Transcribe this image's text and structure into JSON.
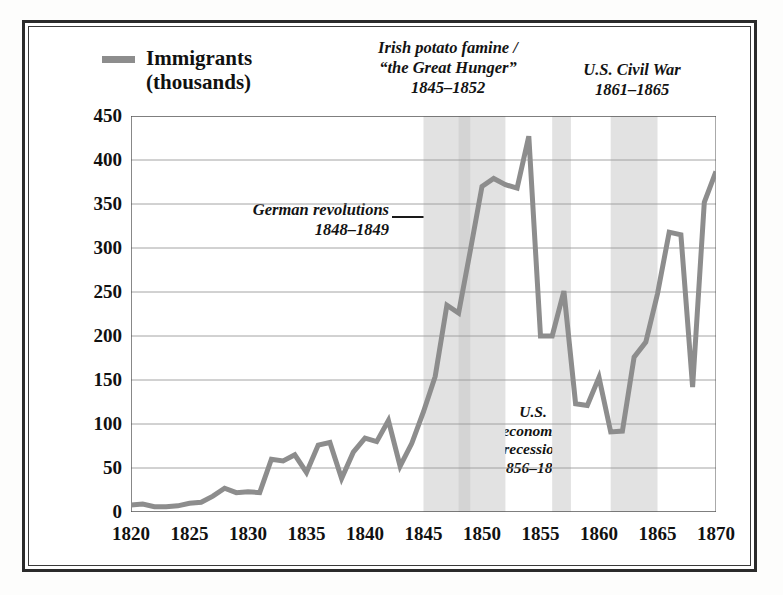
{
  "legend": {
    "label": "Immigrants\n(thousands)",
    "swatch_color": "#8d8d8d"
  },
  "annotations": {
    "famine": "Irish potato famine /\n“the Great Hunger”\n1845–1852",
    "civil_war": "U.S. Civil War\n1861–1865",
    "german": "German revolutions\n1848–1849",
    "recession": "U.S.\neconomic\nrecession\n1856–1857"
  },
  "chart_data": {
    "type": "line",
    "title": "",
    "xlabel": "",
    "ylabel": "Immigrants (thousands)",
    "xlim": [
      1820,
      1870
    ],
    "ylim": [
      0,
      450
    ],
    "xticks": [
      1820,
      1825,
      1830,
      1835,
      1840,
      1845,
      1850,
      1855,
      1860,
      1865,
      1870
    ],
    "yticks": [
      0,
      50,
      100,
      150,
      200,
      250,
      300,
      350,
      400,
      450
    ],
    "grid": "horizontal",
    "legend_position": "above-left",
    "line_color": "#8d8d8d",
    "series": [
      {
        "name": "Immigrants (thousands)",
        "x": [
          1820,
          1821,
          1822,
          1823,
          1824,
          1825,
          1826,
          1827,
          1828,
          1829,
          1830,
          1831,
          1832,
          1833,
          1834,
          1835,
          1836,
          1837,
          1838,
          1839,
          1840,
          1841,
          1842,
          1843,
          1844,
          1845,
          1846,
          1847,
          1848,
          1849,
          1850,
          1851,
          1852,
          1853,
          1854,
          1855,
          1856,
          1857,
          1858,
          1859,
          1860,
          1861,
          1862,
          1863,
          1864,
          1865,
          1866,
          1867,
          1868,
          1869,
          1870
        ],
        "values": [
          8,
          9,
          6,
          6,
          7,
          10,
          11,
          18,
          27,
          22,
          23,
          22,
          60,
          58,
          65,
          45,
          76,
          79,
          38,
          68,
          84,
          80,
          104,
          52,
          78,
          114,
          154,
          235,
          226,
          297,
          370,
          379,
          372,
          368,
          427,
          200,
          200,
          251,
          123,
          121,
          153,
          91,
          92,
          176,
          193,
          248,
          318,
          315,
          142,
          352,
          387
        ]
      }
    ],
    "shaded_bands": [
      {
        "label": "Irish potato famine",
        "start": 1845,
        "end": 1852,
        "color": "#e2e2e2"
      },
      {
        "label": "German revolutions",
        "start": 1848,
        "end": 1849,
        "color": "#d4d4d4"
      },
      {
        "label": "U.S. economic recession",
        "start": 1856,
        "end": 1857.6,
        "color": "#e2e2e2"
      },
      {
        "label": "U.S. Civil War",
        "start": 1861,
        "end": 1865,
        "color": "#e2e2e2"
      }
    ]
  }
}
